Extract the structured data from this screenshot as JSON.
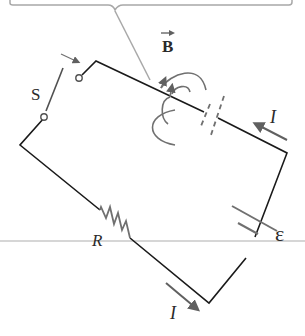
{
  "diagram": {
    "type": "circuit",
    "labels": {
      "switch": "S",
      "resistor": "R",
      "emf": "ε",
      "current_top": "I",
      "current_bottom": "I",
      "field": "B"
    },
    "colors": {
      "wire": "#1a1a1a",
      "component_gray": "#707070",
      "callout": "#a8a8a8",
      "guide_line": "#c8c8c8",
      "background": "#ffffff"
    }
  }
}
